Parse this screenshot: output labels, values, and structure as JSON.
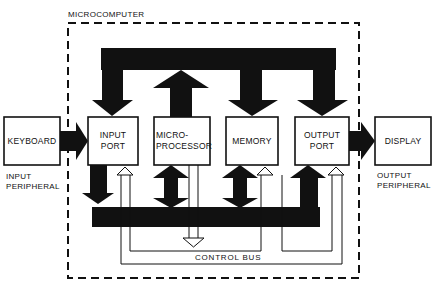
{
  "diagram": {
    "title": "MICROCOMPUTER",
    "blocks": {
      "keyboard": "KEYBOARD",
      "input_port_l1": "INPUT",
      "input_port_l2": "PORT",
      "microprocessor_l1": "MICRO-",
      "microprocessor_l2": "PROCESSOR",
      "memory": "MEMORY",
      "output_port_l1": "OUTPUT",
      "output_port_l2": "PORT",
      "display": "DISPLAY"
    },
    "captions": {
      "input_peripheral_l1": "INPUT",
      "input_peripheral_l2": "PERIPHERAL",
      "output_peripheral_l1": "OUTPUT",
      "output_peripheral_l2": "PERIPHERAL",
      "control_bus": "CONTROL BUS"
    },
    "colors": {
      "ink": "#111111",
      "paper": "#ffffff"
    }
  }
}
